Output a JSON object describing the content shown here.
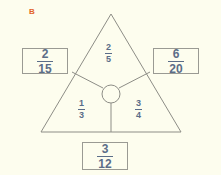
{
  "problem": {
    "letter": "B"
  },
  "diagram": {
    "shape_name": "triangle",
    "center_node_name": "center-circle",
    "regions": [
      {
        "id": "top",
        "numerator": "2",
        "denominator": "5"
      },
      {
        "id": "bottom-left",
        "numerator": "1",
        "denominator": "3"
      },
      {
        "id": "bottom-right",
        "numerator": "3",
        "denominator": "4"
      }
    ],
    "answer_boxes": [
      {
        "id": "left",
        "numerator": "2",
        "denominator": "15"
      },
      {
        "id": "right",
        "numerator": "6",
        "denominator": "20"
      },
      {
        "id": "bottom",
        "numerator": "3",
        "denominator": "12"
      }
    ]
  },
  "colors": {
    "background": "#fdfdee",
    "letter": "#e2622a",
    "ink": "#5b6d88",
    "line": "#8d8d86",
    "box_border": "#9a9a93"
  }
}
